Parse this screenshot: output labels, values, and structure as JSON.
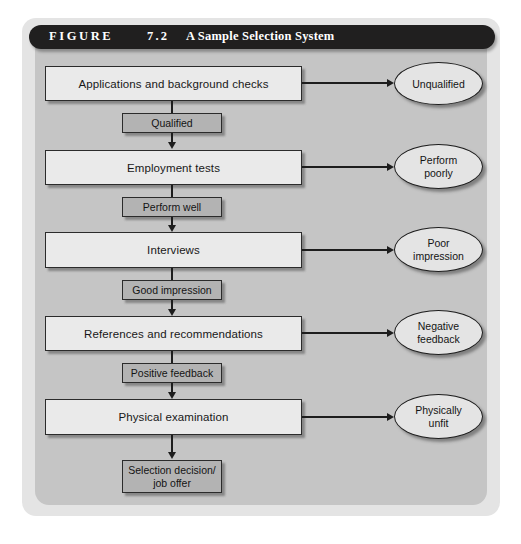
{
  "figure": {
    "label": "FIGURE",
    "number": "7.2",
    "caption": "A Sample Selection System"
  },
  "colors": {
    "page_background": "#ffffff",
    "frame": "#e4e4e4",
    "panel": "#c5c5c5",
    "title_bar": "#201f1f",
    "title_text": "#ffffff",
    "process_box_fill": "#eaeaea",
    "condition_box_fill": "#b3b3b3",
    "terminal_box_fill": "#b3b3b3",
    "ellipse_fill": "#e4e4e4",
    "stroke": "#1d1d1d",
    "text": "#141414"
  },
  "flow": {
    "stages": [
      {
        "id": "applications",
        "label": "Applications and background checks"
      },
      {
        "id": "employment",
        "label": "Employment tests"
      },
      {
        "id": "interviews",
        "label": "Interviews"
      },
      {
        "id": "references",
        "label": "References and recommendations"
      },
      {
        "id": "physical",
        "label": "Physical examination"
      }
    ],
    "conditions": [
      {
        "id": "qualified",
        "label": "Qualified"
      },
      {
        "id": "perform-well",
        "label": "Perform well"
      },
      {
        "id": "good-impression",
        "label": "Good impression"
      },
      {
        "id": "positive-feedback",
        "label": "Positive feedback"
      }
    ],
    "rejections": [
      {
        "id": "unqualified",
        "line1": "Unqualified",
        "line2": ""
      },
      {
        "id": "perform-poorly",
        "line1": "Perform",
        "line2": "poorly"
      },
      {
        "id": "poor-impression",
        "line1": "Poor",
        "line2": "impression"
      },
      {
        "id": "negative-feedback",
        "line1": "Negative",
        "line2": "feedback"
      },
      {
        "id": "physically-unfit",
        "line1": "Physically",
        "line2": "unfit"
      }
    ],
    "terminal": {
      "id": "selection-decision",
      "line1": "Selection decision/",
      "line2": "job offer"
    }
  }
}
